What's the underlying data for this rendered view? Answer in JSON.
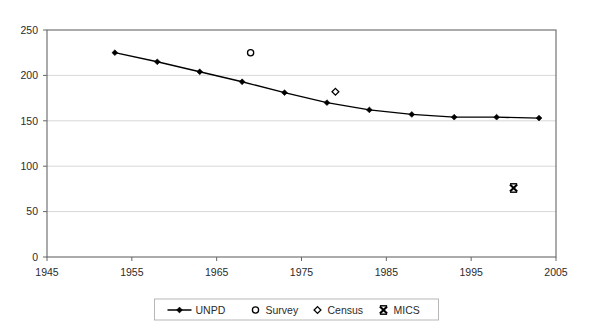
{
  "chart_data": {
    "type": "line",
    "title": "",
    "subtitle": "",
    "xlabel": "",
    "ylabel": "",
    "xlim": [
      1945,
      2005
    ],
    "ylim": [
      0,
      250
    ],
    "x_ticks": [
      1945,
      1955,
      1965,
      1975,
      1985,
      1995,
      2005
    ],
    "x_tick_labels": [
      "1945",
      "1955",
      "1965",
      "1975",
      "1985",
      "1995",
      "2005"
    ],
    "y_ticks": [
      0,
      50,
      100,
      150,
      200,
      250
    ],
    "y_tick_labels": [
      "0",
      "50",
      "100",
      "150",
      "200",
      "250"
    ],
    "grid": "horizontal",
    "legend_position": "bottom",
    "series": [
      {
        "name": "UNPD",
        "type": "line",
        "marker": "filled-diamond",
        "color": "#000000",
        "points": [
          {
            "x": 1953,
            "y": 225
          },
          {
            "x": 1958,
            "y": 215
          },
          {
            "x": 1963,
            "y": 204
          },
          {
            "x": 1968,
            "y": 193
          },
          {
            "x": 1973,
            "y": 181
          },
          {
            "x": 1978,
            "y": 170
          },
          {
            "x": 1983,
            "y": 162
          },
          {
            "x": 1988,
            "y": 157
          },
          {
            "x": 1993,
            "y": 154
          },
          {
            "x": 1998,
            "y": 154
          },
          {
            "x": 2003,
            "y": 153
          }
        ]
      },
      {
        "name": "Survey",
        "type": "scatter",
        "marker": "open-circle",
        "color": "#000000",
        "points": [
          {
            "x": 1969,
            "y": 225
          }
        ]
      },
      {
        "name": "Census",
        "type": "scatter",
        "marker": "open-diamond",
        "color": "#000000",
        "points": [
          {
            "x": 1979,
            "y": 182
          }
        ]
      },
      {
        "name": "MICS",
        "type": "scatter",
        "marker": "x-cross",
        "color": "#000000",
        "points": [
          {
            "x": 2000,
            "y": 76
          }
        ]
      }
    ]
  },
  "legend": {
    "items": [
      {
        "label": "UNPD",
        "marker": "line-with-filled-diamond"
      },
      {
        "label": "Survey",
        "marker": "open-circle"
      },
      {
        "label": "Census",
        "marker": "open-diamond"
      },
      {
        "label": "MICS",
        "marker": "x-cross"
      }
    ]
  },
  "colors": {
    "series": "#000000",
    "grid": "#d8d8d8",
    "axis": "#555555",
    "text": "#2b2b2b",
    "background": "#ffffff"
  }
}
